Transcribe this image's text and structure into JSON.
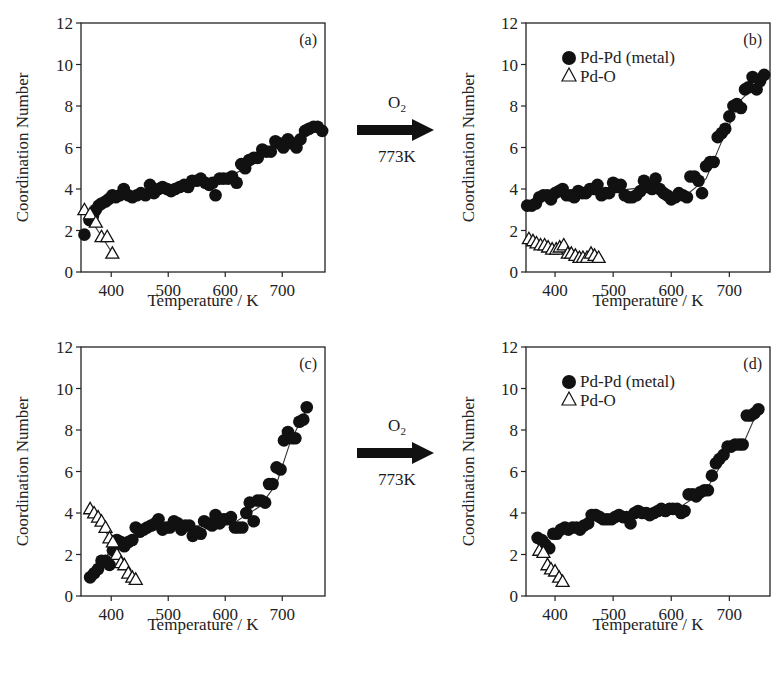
{
  "figure": {
    "arrows": [
      {
        "gas": "O",
        "gas_sub": "2",
        "temperature": "773K"
      },
      {
        "gas": "O",
        "gas_sub": "2",
        "temperature": "773K"
      }
    ]
  },
  "chart_data": [
    {
      "panel": "(a)",
      "type": "scatter",
      "title": "",
      "xlabel": "Temperature / K",
      "ylabel": "Coordination Number",
      "xlim": [
        347,
        775
      ],
      "ylim": [
        0,
        12
      ],
      "xticks": [
        400,
        500,
        600,
        700
      ],
      "yticks": [
        0,
        2,
        4,
        6,
        8,
        10,
        12
      ],
      "legend": null,
      "grid": false,
      "series": [
        {
          "name": "Pd-Pd (metal)",
          "marker": "filled-circle",
          "x": [
            353,
            362,
            368,
            373,
            378,
            383,
            390,
            395,
            402,
            408,
            415,
            422,
            430,
            437,
            445,
            452,
            460,
            468,
            475,
            483,
            490,
            498,
            505,
            512,
            520,
            528,
            535,
            542,
            550,
            557,
            565,
            572,
            578,
            583,
            590,
            597,
            605,
            612,
            620,
            628,
            635,
            642,
            650,
            657,
            665,
            672,
            680,
            688,
            695,
            702,
            710,
            717,
            725,
            732,
            740,
            747,
            755,
            762,
            770
          ],
          "y": [
            1.8,
            2.5,
            2.7,
            3.0,
            3.2,
            3.3,
            3.4,
            3.5,
            3.7,
            3.6,
            3.7,
            4.0,
            3.7,
            3.6,
            3.7,
            3.8,
            3.7,
            4.2,
            3.8,
            4.0,
            4.1,
            4.0,
            3.9,
            4.0,
            4.1,
            4.2,
            4.1,
            4.4,
            4.4,
            4.5,
            4.3,
            4.2,
            4.3,
            3.7,
            4.5,
            4.5,
            4.5,
            4.6,
            4.3,
            5.2,
            5.0,
            5.4,
            5.5,
            5.5,
            5.9,
            5.8,
            5.8,
            6.3,
            6.2,
            6.0,
            6.4,
            6.2,
            6.0,
            6.4,
            6.8,
            6.9,
            7.0,
            7.0,
            6.8
          ]
        },
        {
          "name": "Pd-O",
          "marker": "open-triangle",
          "x": [
            353,
            363,
            373,
            383,
            393,
            402
          ],
          "y": [
            3.0,
            2.8,
            2.4,
            1.7,
            1.7,
            0.9
          ]
        }
      ],
      "fit_lines": [
        {
          "name": "Pd-Pd fit",
          "x": [
            353,
            380,
            420,
            500,
            600,
            650,
            700,
            770
          ],
          "y": [
            2.6,
            3.2,
            3.7,
            4.0,
            4.5,
            5.2,
            6.2,
            7.0
          ]
        },
        {
          "name": "Pd-O fit",
          "x": [
            353,
            402
          ],
          "y": [
            3.0,
            0.9
          ]
        }
      ],
      "annotations": [
        "(a)"
      ]
    },
    {
      "panel": "(b)",
      "type": "scatter",
      "title": "",
      "xlabel": "Temperature / K",
      "ylabel": "Coordination Number",
      "xlim": [
        350,
        770
      ],
      "ylim": [
        0,
        12
      ],
      "xticks": [
        400,
        500,
        600,
        700
      ],
      "yticks": [
        0,
        2,
        4,
        6,
        8,
        10,
        12
      ],
      "legend": {
        "position": "upper-left",
        "entries": [
          "Pd-Pd (metal)",
          "Pd-O"
        ]
      },
      "grid": false,
      "series": [
        {
          "name": "Pd-Pd (metal)",
          "marker": "filled-circle",
          "x": [
            352,
            360,
            367,
            373,
            380,
            387,
            393,
            400,
            407,
            413,
            420,
            427,
            433,
            440,
            447,
            453,
            460,
            467,
            473,
            480,
            487,
            493,
            500,
            507,
            513,
            520,
            527,
            533,
            540,
            547,
            553,
            560,
            567,
            573,
            580,
            587,
            593,
            600,
            607,
            613,
            620,
            627,
            633,
            640,
            647,
            653,
            660,
            667,
            673,
            680,
            687,
            693,
            700,
            707,
            713,
            720,
            727,
            733,
            740,
            747,
            753,
            760
          ],
          "y": [
            3.2,
            3.2,
            3.3,
            3.6,
            3.7,
            3.7,
            3.5,
            3.8,
            3.9,
            4.0,
            3.7,
            3.7,
            3.6,
            3.9,
            3.8,
            3.8,
            4.0,
            4.0,
            4.2,
            3.7,
            3.8,
            3.8,
            4.3,
            4.1,
            4.2,
            3.7,
            3.6,
            3.6,
            3.7,
            3.9,
            4.4,
            4.1,
            4.0,
            4.5,
            4.0,
            3.8,
            3.7,
            3.5,
            3.6,
            3.8,
            3.7,
            3.6,
            4.6,
            4.6,
            4.4,
            3.8,
            5.1,
            5.3,
            5.3,
            6.5,
            6.7,
            6.9,
            7.5,
            8.0,
            8.1,
            7.9,
            8.8,
            8.9,
            9.4,
            8.8,
            9.2,
            9.5
          ]
        },
        {
          "name": "Pd-O",
          "marker": "open-triangle",
          "x": [
            355,
            362,
            368,
            375,
            382,
            388,
            395,
            402,
            408,
            415,
            422,
            428,
            435,
            442,
            448,
            455,
            462,
            468,
            475
          ],
          "y": [
            1.6,
            1.5,
            1.4,
            1.3,
            1.3,
            1.2,
            1.1,
            1.1,
            1.2,
            1.3,
            0.9,
            0.9,
            0.8,
            0.7,
            0.7,
            0.7,
            0.9,
            0.8,
            0.7
          ]
        }
      ],
      "fit_lines": [
        {
          "name": "Pd-Pd fit",
          "x": [
            352,
            400,
            500,
            560,
            600,
            630,
            660,
            690,
            720,
            760
          ],
          "y": [
            3.3,
            3.7,
            3.9,
            4.1,
            3.8,
            3.8,
            4.5,
            6.5,
            8.3,
            9.4
          ]
        },
        {
          "name": "Pd-O fit",
          "x": [
            352,
            478
          ],
          "y": [
            1.6,
            0.6
          ]
        }
      ],
      "annotations": [
        "(b)"
      ]
    },
    {
      "panel": "(c)",
      "type": "scatter",
      "title": "",
      "xlabel": "Temperature / K",
      "ylabel": "Coordination Number",
      "xlim": [
        347,
        775
      ],
      "ylim": [
        0,
        12
      ],
      "xticks": [
        400,
        500,
        600,
        700
      ],
      "yticks": [
        0,
        2,
        4,
        6,
        8,
        10,
        12
      ],
      "legend": null,
      "grid": false,
      "series": [
        {
          "name": "Pd-Pd (metal)",
          "marker": "filled-circle",
          "x": [
            363,
            370,
            377,
            383,
            390,
            397,
            403,
            410,
            417,
            423,
            430,
            437,
            443,
            450,
            457,
            463,
            470,
            477,
            483,
            490,
            497,
            503,
            510,
            517,
            523,
            530,
            537,
            543,
            550,
            557,
            563,
            570,
            577,
            583,
            590,
            597,
            603,
            610,
            617,
            623,
            630,
            637,
            643,
            650,
            657,
            663,
            670,
            677,
            683,
            690,
            697,
            703,
            710,
            717,
            723,
            730,
            737,
            743
          ],
          "y": [
            0.9,
            1.1,
            1.3,
            1.7,
            1.7,
            1.5,
            2.2,
            2.7,
            2.6,
            2.4,
            2.6,
            2.7,
            3.3,
            3.1,
            3.2,
            3.3,
            3.4,
            3.5,
            3.7,
            3.2,
            3.3,
            3.3,
            3.6,
            3.5,
            3.2,
            3.4,
            3.4,
            2.9,
            3.1,
            3.0,
            3.6,
            3.5,
            3.4,
            3.9,
            3.5,
            3.7,
            3.7,
            3.8,
            3.3,
            3.3,
            3.3,
            4.0,
            4.5,
            3.6,
            4.6,
            4.6,
            4.5,
            5.4,
            5.4,
            6.2,
            6.1,
            7.5,
            7.9,
            7.6,
            7.6,
            8.4,
            8.5,
            9.1
          ]
        },
        {
          "name": "Pd-O",
          "marker": "open-triangle",
          "x": [
            363,
            370,
            377,
            383,
            390,
            397,
            403,
            410,
            417,
            423,
            430,
            437,
            443
          ],
          "y": [
            4.2,
            4.0,
            3.8,
            3.6,
            3.3,
            2.8,
            2.6,
            2.0,
            1.6,
            1.5,
            1.1,
            0.9,
            0.8
          ]
        }
      ],
      "fit_lines": [
        {
          "name": "Pd-Pd fit",
          "x": [
            363,
            400,
            440,
            480,
            560,
            620,
            660,
            690,
            715,
            743
          ],
          "y": [
            1.0,
            2.2,
            2.9,
            3.2,
            3.4,
            3.6,
            4.3,
            5.4,
            7.5,
            9.0
          ]
        },
        {
          "name": "Pd-O fit",
          "x": [
            363,
            445
          ],
          "y": [
            4.3,
            0.7
          ]
        }
      ],
      "annotations": [
        "(c)"
      ]
    },
    {
      "panel": "(d)",
      "type": "scatter",
      "title": "",
      "xlabel": "Temperature / K",
      "ylabel": "Coordination Number",
      "xlim": [
        350,
        770
      ],
      "ylim": [
        0,
        12
      ],
      "xticks": [
        400,
        500,
        600,
        700
      ],
      "yticks": [
        0,
        2,
        4,
        6,
        8,
        10,
        12
      ],
      "legend": {
        "position": "upper-left",
        "entries": [
          "Pd-Pd (metal)",
          "Pd-O"
        ]
      },
      "grid": false,
      "series": [
        {
          "name": "Pd-Pd (metal)",
          "marker": "filled-circle",
          "x": [
            370,
            377,
            383,
            390,
            397,
            403,
            410,
            417,
            423,
            430,
            437,
            443,
            450,
            457,
            463,
            470,
            477,
            483,
            490,
            497,
            503,
            510,
            517,
            523,
            530,
            537,
            543,
            550,
            557,
            563,
            570,
            577,
            583,
            590,
            597,
            603,
            610,
            617,
            623,
            630,
            637,
            643,
            650,
            657,
            663,
            670,
            677,
            683,
            690,
            697,
            703,
            710,
            717,
            723,
            730,
            737,
            743,
            750
          ],
          "y": [
            2.8,
            2.7,
            2.5,
            2.3,
            3.0,
            3.0,
            3.2,
            3.3,
            3.2,
            3.3,
            3.3,
            3.2,
            3.4,
            3.5,
            3.9,
            3.9,
            3.8,
            3.7,
            3.7,
            3.7,
            3.8,
            3.9,
            3.8,
            3.8,
            3.5,
            4.0,
            4.1,
            4.0,
            4.0,
            3.9,
            4.0,
            4.1,
            4.2,
            4.1,
            4.2,
            4.2,
            4.2,
            4.0,
            4.1,
            4.9,
            4.9,
            4.8,
            5.0,
            5.1,
            5.1,
            5.8,
            6.4,
            6.6,
            6.8,
            7.2,
            7.2,
            7.3,
            7.3,
            7.3,
            8.7,
            8.7,
            8.8,
            9.0
          ]
        },
        {
          "name": "Pd-O",
          "marker": "open-triangle",
          "x": [
            373,
            380,
            387,
            393,
            400,
            407,
            413
          ],
          "y": [
            2.2,
            2.1,
            1.5,
            1.3,
            1.2,
            0.9,
            0.7
          ]
        }
      ],
      "fit_lines": [
        {
          "name": "Pd-Pd fit",
          "x": [
            370,
            400,
            460,
            540,
            610,
            660,
            700,
            725,
            750
          ],
          "y": [
            2.6,
            3.0,
            3.7,
            3.9,
            4.2,
            5.1,
            7.0,
            7.4,
            9.0
          ]
        },
        {
          "name": "Pd-O fit",
          "x": [
            373,
            415
          ],
          "y": [
            2.4,
            0.6
          ]
        }
      ],
      "annotations": [
        "(d)"
      ]
    }
  ]
}
